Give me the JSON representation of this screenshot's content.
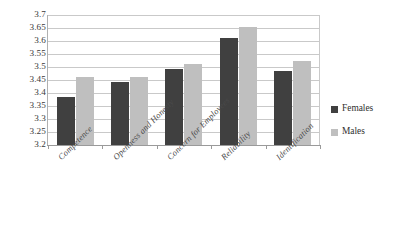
{
  "chart_data": {
    "type": "bar",
    "title": "",
    "subtitle": "",
    "xlabel": "",
    "ylabel": "",
    "ylim": [
      3.2,
      3.7
    ],
    "ytick_step": 0.05,
    "yticks": [
      "3.7",
      "3.65",
      "3.6",
      "3.55",
      "3.5",
      "3.45",
      "3.4",
      "3.35",
      "3.3",
      "3.25",
      "3.2"
    ],
    "grid": "horizontal",
    "legend_position": "right",
    "categories": [
      "Competence",
      "Openness and Honesty",
      "Concern for Employees",
      "Reliability",
      "Identification"
    ],
    "series": [
      {
        "name": "Females",
        "color": "#404040",
        "values": [
          3.383,
          3.443,
          3.492,
          3.613,
          3.485
        ]
      },
      {
        "name": "Males",
        "color": "#bfbfbf",
        "values": [
          3.46,
          3.462,
          3.51,
          3.652,
          3.522
        ]
      }
    ]
  },
  "legend": {
    "items": [
      {
        "label": "Females",
        "swatch": "females"
      },
      {
        "label": "Males",
        "swatch": "males"
      }
    ]
  },
  "colors": {
    "females": "#404040",
    "males": "#bfbfbf",
    "gridline": "#c9c9c9",
    "axis": "#9a9a9a",
    "text": "#3a3a3a",
    "background": "#ffffff"
  }
}
